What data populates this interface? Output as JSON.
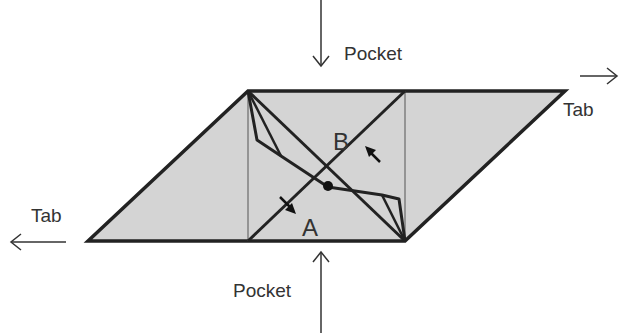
{
  "diagram": {
    "labels": {
      "pocket_top": "Pocket",
      "pocket_bottom": "Pocket",
      "tab_right": "Tab",
      "tab_left": "Tab",
      "region_a": "A",
      "region_b": "B"
    },
    "colors": {
      "fill": "#d4d4d4",
      "stroke": "#222222",
      "thin_stroke": "#555555",
      "text": "#333333"
    }
  }
}
